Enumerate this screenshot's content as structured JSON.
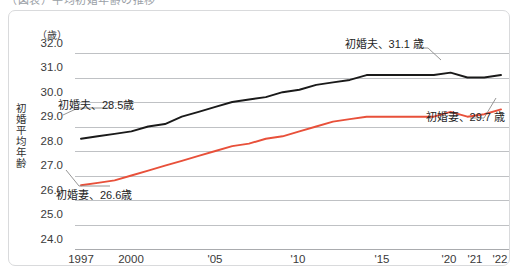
{
  "caption": {
    "text": "（図表）平均初婚年齢の推移"
  },
  "axis": {
    "y_unit": "（歳）",
    "y_title": "初婚平均年齢",
    "y_ticks": [
      "32.0",
      "31.0",
      "30.0",
      "29.0",
      "28.0",
      "27.0",
      "26.0",
      "25.0",
      "24.0"
    ],
    "x_ticks": [
      "1997",
      "2000",
      "'05",
      "'10",
      "'15",
      "'20",
      "'21",
      "'22"
    ]
  },
  "annotations": {
    "husband_start": "初婚夫、28.5歳",
    "husband_end": "初婚夫、31.1 歳",
    "wife_start": "初婚妻、26.6歳",
    "wife_end": "初婚妻、29.7 歳"
  },
  "colors": {
    "husband_line": "#1a1a1a",
    "wife_line": "#e8503a",
    "grid": "#bfc1c4",
    "panel_border": "#d9dadc",
    "text": "#3a3a3a"
  },
  "chart_data": {
    "type": "line",
    "title": "",
    "xlabel": "",
    "ylabel": "初婚平均年齢",
    "y_unit": "歳",
    "ylim": [
      24.0,
      32.0
    ],
    "ytick_step": 1.0,
    "grid": true,
    "legend": "annotations",
    "x": [
      1997,
      1998,
      1999,
      2000,
      2001,
      2002,
      2003,
      2004,
      2005,
      2006,
      2007,
      2008,
      2009,
      2010,
      2011,
      2012,
      2013,
      2014,
      2015,
      2016,
      2017,
      2018,
      2019,
      2020,
      2021,
      2022
    ],
    "x_tick_labels": [
      "1997",
      "2000",
      "'05",
      "'10",
      "'15",
      "'20",
      "'21",
      "'22"
    ],
    "x_tick_values": [
      1997,
      2000,
      2005,
      2010,
      2015,
      2020,
      2021,
      2022
    ],
    "series": [
      {
        "name": "初婚夫",
        "color": "#1a1a1a",
        "start_label": "初婚夫、28.5歳",
        "end_label": "初婚夫、31.1 歳",
        "values": [
          28.5,
          28.6,
          28.7,
          28.8,
          29.0,
          29.1,
          29.4,
          29.6,
          29.8,
          30.0,
          30.1,
          30.2,
          30.4,
          30.5,
          30.7,
          30.8,
          30.9,
          31.1,
          31.1,
          31.1,
          31.1,
          31.1,
          31.2,
          31.0,
          31.0,
          31.1
        ]
      },
      {
        "name": "初婚妻",
        "color": "#e8503a",
        "start_label": "初婚妻、26.6歳",
        "end_label": "初婚妻、29.7 歳",
        "values": [
          26.6,
          26.7,
          26.8,
          27.0,
          27.2,
          27.4,
          27.6,
          27.8,
          28.0,
          28.2,
          28.3,
          28.5,
          28.6,
          28.8,
          29.0,
          29.2,
          29.3,
          29.4,
          29.4,
          29.4,
          29.4,
          29.4,
          29.6,
          29.4,
          29.5,
          29.7
        ]
      }
    ]
  }
}
